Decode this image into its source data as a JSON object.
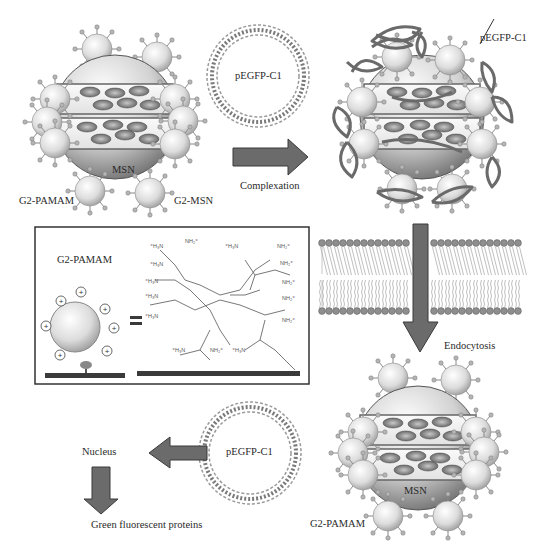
{
  "diagram": {
    "top_left": {
      "core_label": "MSN",
      "pamam_label": "G2-PAMAM",
      "complex_label": "G2-MSN"
    },
    "plasmid_top": {
      "label": "pEGFP-C1"
    },
    "arrow_complexation": {
      "label": "Complexation"
    },
    "top_right": {
      "plasmid_pointer_label": "pEGFP-C1"
    },
    "inset_box": {
      "title": "G2-PAMAM",
      "equals_sign": "=",
      "charge_symbol": "+",
      "amine_groups": [
        "+H3N",
        "NH2+",
        "+H3N",
        "NH2+"
      ]
    },
    "membrane": {
      "label": "Endocytosis"
    },
    "bottom_right": {
      "core_label": "MSN",
      "pamam_label": "G2-PAMAM"
    },
    "plasmid_bottom": {
      "label": "pEGFP-C1"
    },
    "nucleus": {
      "label": "Nucleus"
    },
    "result": {
      "label": "Green fluorescent proteins"
    },
    "colors": {
      "arrow_fill": "#6b6b6b",
      "arrow_stroke": "#3a3a3a",
      "sphere_light": "#f2f2f2",
      "sphere_dark": "#8a8a8a",
      "dna": "#7a7a7a",
      "membrane_head": "#8e8e8e"
    }
  }
}
